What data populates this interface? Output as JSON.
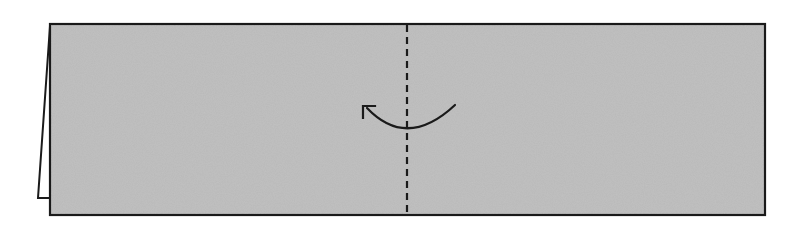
{
  "diagram": {
    "type": "origami-fold-step",
    "colors": {
      "background": "#ffffff",
      "paper": "#b9b9b9",
      "outline": "#1a1a1a",
      "flap": "#ffffff"
    },
    "paper": {
      "x": 50,
      "y": 24,
      "width": 715,
      "height": 191
    },
    "flap": {
      "points": "50,26 38,198 50,198"
    },
    "fold_line": {
      "x": 407,
      "y1": 24,
      "y2": 215,
      "style": "dashed"
    },
    "arrow": {
      "direction": "right-to-left",
      "path": "M455,105 Q407,150 367,108"
    }
  }
}
